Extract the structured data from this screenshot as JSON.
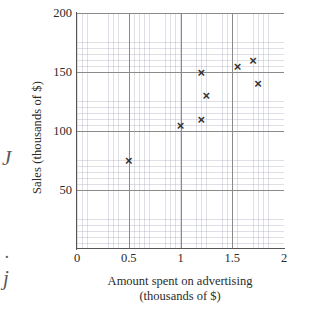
{
  "chart_data": {
    "type": "scatter",
    "title": "",
    "xlabel": "Amount spent on advertising (thousands of $)",
    "xlabel_line1": "Amount spent on advertising",
    "xlabel_line2": "(thousands of $)",
    "ylabel": "Sales (thousands of $)",
    "xlim": [
      0,
      2
    ],
    "ylim": [
      0,
      200
    ],
    "xticks": [
      0,
      0.5,
      1,
      1.5,
      2
    ],
    "xtick_labels": [
      "0",
      "0.5",
      "1",
      "1.5",
      "2"
    ],
    "yticks": [
      50,
      100,
      150,
      200
    ],
    "ytick_labels": [
      "50",
      "100",
      "150",
      "200"
    ],
    "grid": true,
    "grid_minor_x_step": 0.05,
    "grid_minor_y_step": 5,
    "grid_major_x_step": 0.5,
    "grid_major_y_step": 50,
    "legend": null,
    "marker": "x",
    "marker_color": "#333333",
    "grid_color": "#9696af",
    "axis_color": "#555555",
    "points": [
      {
        "x": 0.5,
        "y": 75
      },
      {
        "x": 1.0,
        "y": 105
      },
      {
        "x": 1.2,
        "y": 110
      },
      {
        "x": 1.2,
        "y": 150
      },
      {
        "x": 1.25,
        "y": 130
      },
      {
        "x": 1.55,
        "y": 155
      },
      {
        "x": 1.7,
        "y": 160
      },
      {
        "x": 1.75,
        "y": 140
      }
    ]
  },
  "margin_artifacts": {
    "glyph_1": "J",
    "glyph_2": ".",
    "glyph_3": "j"
  },
  "marker_glyph": "×"
}
